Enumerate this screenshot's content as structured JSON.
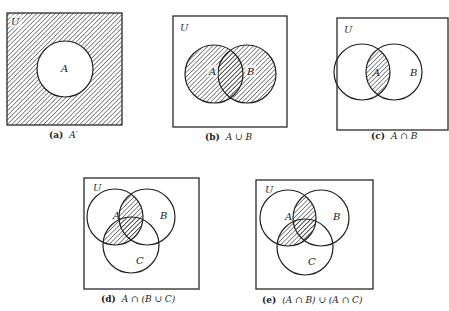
{
  "universe_label": "U",
  "colors": {
    "stroke": "#222222",
    "hatch": "#333333",
    "background": "#ffffff"
  },
  "diagrams": [
    {
      "id": "a",
      "caption_prefix": "(a)",
      "caption_expr": "A′",
      "shaded_region": "complement of A",
      "sets": [
        {
          "label": "A"
        }
      ]
    },
    {
      "id": "b",
      "caption_prefix": "(b)",
      "caption_expr": "A ∪ B",
      "shaded_region": "A union B",
      "sets": [
        {
          "label": "A"
        },
        {
          "label": "B"
        }
      ]
    },
    {
      "id": "c",
      "caption_prefix": "(c)",
      "caption_expr": "A ∩ B",
      "shaded_region": "A intersect B",
      "sets": [
        {
          "label": "A"
        },
        {
          "label": "B"
        }
      ]
    },
    {
      "id": "d",
      "caption_prefix": "(d)",
      "caption_expr": "A ∩ (B ∪ C)",
      "shaded_region": "A intersect (B union C)",
      "sets": [
        {
          "label": "A"
        },
        {
          "label": "B"
        },
        {
          "label": "C"
        }
      ]
    },
    {
      "id": "e",
      "caption_prefix": "(e)",
      "caption_expr": "(A ∩ B) ∪ (A ∩ C)",
      "shaded_region": "(A intersect B) union (A intersect C)",
      "sets": [
        {
          "label": "A"
        },
        {
          "label": "B"
        },
        {
          "label": "C"
        }
      ]
    }
  ]
}
